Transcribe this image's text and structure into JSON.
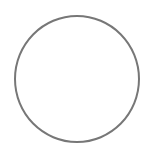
{
  "shape": {
    "type": "circle-outline",
    "stroke_color": "#777777",
    "fill_color": "#ffffff"
  }
}
